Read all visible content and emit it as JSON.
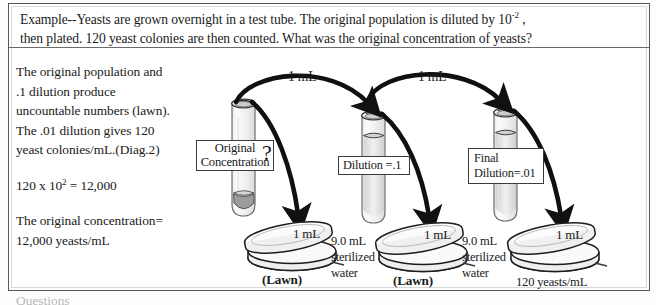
{
  "prompt": {
    "line1_a": "Example--Yeasts are grown overnight in a test tube.  The original population is diluted by 10",
    "line1_sup": "-2",
    "line1_b": " ,",
    "line2": "then plated.  120 yeast colonies are then counted.  What was the original concentration of yeasts?"
  },
  "left_column": {
    "para1_l1": "The original population and",
    "para1_l2": ".1 dilution produce",
    "para1_l3": "uncountable numbers (lawn).",
    "para1_l4": "The .01 dilution gives 120",
    "para1_l5": "yeast colonies/mL.(Diag.2)",
    "calc_a": "120 x 10",
    "calc_sup": "2",
    "calc_b": " =  12,000",
    "para3_l1": "The original concentration=",
    "para3_l2": "12,000 yeasts/mL"
  },
  "clipped_text": "Questions",
  "diagram": {
    "tube1_label_l1": "Original",
    "tube1_label_l2": "Concentration",
    "tube1_question": "?",
    "tube2_label": "Dilution =.1",
    "tube3_label_l1": "Final",
    "tube3_label_l2": "Dilution=.01",
    "transfer_1": "1 mL",
    "transfer_2": "1 mL",
    "plate_1": "1 mL",
    "plate_2": "1 mL",
    "plate_3": "1 mL",
    "lawn_1": "(Lawn)",
    "lawn_2": "(Lawn)",
    "water_1_l1": "9.0 mL",
    "water_1_l2": "sterilized",
    "water_1_l3": "water",
    "water_2_l1": "9.0 mL",
    "water_2_l2": "sterilized",
    "water_2_l3": "water",
    "result_count": "120 yeasts/mL"
  },
  "colors": {
    "ink": "#1a1a1a",
    "frame": "#58585a",
    "glass": "#9a9a9c",
    "paper": "#ffffff"
  }
}
